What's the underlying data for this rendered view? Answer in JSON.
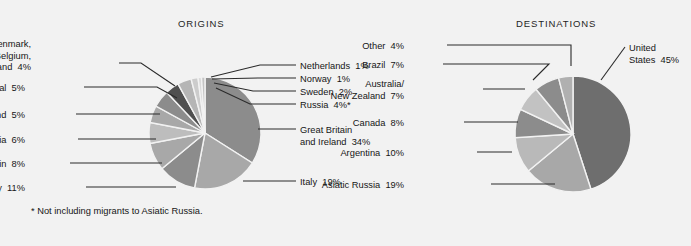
{
  "background_color": "#f2f2f2",
  "text_color": "#161616",
  "charts": {
    "origins": {
      "title": "ORIGINS",
      "center": [
        205,
        133
      ],
      "radius": 56,
      "footnote": "* Not including migrants to Asiatic Russia."
    },
    "destinations": {
      "title": "DESTINATIONS",
      "center": [
        573,
        134
      ],
      "radius": 58
    }
  },
  "chart_data": [
    {
      "type": "pie",
      "title": "ORIGINS",
      "unit": "percent",
      "labels": [
        "Great Britain and Ireland",
        "Italy",
        "Germany",
        "Spain",
        "Austria",
        "Poland",
        "Portugal",
        "Finland, Denmark, France, Belgium, Switzerland",
        "Russia",
        "Sweden",
        "Norway",
        "Netherlands"
      ],
      "values": [
        34,
        19,
        11,
        8,
        6,
        5,
        5,
        4,
        4,
        2,
        1,
        1
      ],
      "value_labels": [
        "Great Britain and Ireland  34%",
        "Italy  19%",
        "Germany  11%",
        "Spain  8%",
        "Austria  6%",
        "Poland  5%",
        "Portugal  5%",
        "Finland, Denmark, France, Belgium, Switzerland  4%",
        "Russia  4%*",
        "Sweden  2%",
        "Norway  1%",
        "Netherlands  1%"
      ],
      "colors": [
        "#8c8c8c",
        "#a8a8a8",
        "#8c8c8c",
        "#a8a8a8",
        "#bdbdbd",
        "#a8a8a8",
        "#8c8c8c",
        "#4f4f4f",
        "#b5b5b5",
        "#cccccc",
        "#dadada",
        "#c4c4c4"
      ],
      "footnote": "* Not including migrants to Asiatic Russia.",
      "legend_position": "callout-leader-lines"
    },
    {
      "type": "pie",
      "title": "DESTINATIONS",
      "unit": "percent",
      "labels": [
        "United States",
        "Asiatic Russia",
        "Argentina",
        "Canada",
        "Australia/New Zealand",
        "Brazil",
        "Other"
      ],
      "values": [
        45,
        19,
        10,
        8,
        7,
        7,
        4
      ],
      "value_labels": [
        "United States  45%",
        "Asiatic Russia  19%",
        "Argentina  10%",
        "Canada  8%",
        "Australia/ New Zealand  7%",
        "Brazil  7%",
        "Other  4%"
      ],
      "colors": [
        "#6e6e6e",
        "#a8a8a8",
        "#b9b9b9",
        "#8c8c8c",
        "#c2c2c2",
        "#8c8c8c",
        "#b0b0b0"
      ],
      "legend_position": "callout-leader-lines"
    }
  ],
  "labels": {
    "origins_left": [
      {
        "id": "finland-group",
        "text": "Finland, Denmark,\nFrance, Belgium,\nSwitzerland  4%",
        "x": 31,
        "y": 39
      },
      {
        "id": "portugal",
        "text": "Portugal  5%",
        "x": 25,
        "y": 83
      },
      {
        "id": "poland",
        "text": "Poland  5%",
        "x": 25,
        "y": 110
      },
      {
        "id": "austria",
        "text": "Austria  6%",
        "x": 25,
        "y": 135
      },
      {
        "id": "spain",
        "text": "Spain  8%",
        "x": 25,
        "y": 159
      },
      {
        "id": "germany",
        "text": "Germany  11%",
        "x": 25,
        "y": 183
      }
    ],
    "origins_right": [
      {
        "id": "netherlands",
        "text": "Netherlands  1%",
        "x": 300,
        "y": 61
      },
      {
        "id": "norway",
        "text": "Norway  1%",
        "x": 300,
        "y": 74
      },
      {
        "id": "sweden",
        "text": "Sweden  2%",
        "x": 300,
        "y": 87
      },
      {
        "id": "russia",
        "text": "Russia  4%*",
        "x": 300,
        "y": 100
      },
      {
        "id": "great-britain",
        "text": "Great Britain\nand Ireland  34%",
        "x": 300,
        "y": 125
      },
      {
        "id": "italy",
        "text": "Italy  19%",
        "x": 300,
        "y": 177
      }
    ],
    "destinations_left": [
      {
        "id": "other",
        "text": "Other  4%",
        "x": 404,
        "y": 41
      },
      {
        "id": "brazil",
        "text": "Brazil  7%",
        "x": 404,
        "y": 60
      },
      {
        "id": "australia-nz",
        "text": "Australia/\nNew Zealand  7%",
        "x": 404,
        "y": 79
      },
      {
        "id": "canada",
        "text": "Canada  8%",
        "x": 404,
        "y": 118
      },
      {
        "id": "argentina",
        "text": "Argentina  10%",
        "x": 404,
        "y": 148
      },
      {
        "id": "asiatic-russia",
        "text": "Asiatic Russia  19%",
        "x": 404,
        "y": 180
      }
    ],
    "destinations_right": [
      {
        "id": "united-states",
        "text": "United\nStates  45%",
        "x": 629,
        "y": 43
      }
    ]
  }
}
